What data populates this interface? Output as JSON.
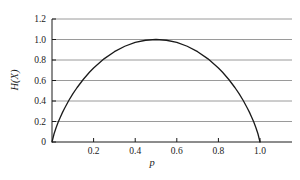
{
  "chart_data": {
    "type": "line",
    "title": "",
    "xlabel": "p",
    "ylabel": "H(X)",
    "xlim": [
      0,
      1.1538
    ],
    "ylim": [
      0,
      1.2
    ],
    "grid": "horizontal",
    "legend": null,
    "x_ticks": [
      0.2,
      0.4,
      0.6,
      0.8,
      1.0
    ],
    "x_tick_labels": [
      "0.2",
      "0.4",
      "0.6",
      "0.8",
      "1.0"
    ],
    "y_ticks": [
      0,
      0.2,
      0.4,
      0.6,
      0.8,
      1.0,
      1.2
    ],
    "y_tick_labels": [
      "0",
      "0.2",
      "0.4",
      "0.6",
      "0.8",
      "1.0",
      "1.2"
    ],
    "series": [
      {
        "name": "H(X)",
        "color": "#1a1a1a",
        "x": [
          0.0,
          0.01,
          0.02,
          0.03,
          0.04,
          0.05,
          0.06,
          0.08,
          0.1,
          0.12,
          0.15,
          0.18,
          0.2,
          0.25,
          0.3,
          0.35,
          0.4,
          0.45,
          0.5,
          0.55,
          0.6,
          0.65,
          0.7,
          0.75,
          0.8,
          0.82,
          0.85,
          0.88,
          0.9,
          0.92,
          0.94,
          0.95,
          0.96,
          0.97,
          0.98,
          0.99,
          1.0
        ],
        "y": [
          0.0,
          0.0808,
          0.1414,
          0.1944,
          0.2423,
          0.2864,
          0.3274,
          0.4022,
          0.469,
          0.5294,
          0.6098,
          0.6801,
          0.7219,
          0.8113,
          0.8813,
          0.9341,
          0.971,
          0.9928,
          1.0,
          0.9928,
          0.971,
          0.9341,
          0.8813,
          0.8113,
          0.7219,
          0.6801,
          0.6098,
          0.5294,
          0.469,
          0.4022,
          0.3274,
          0.2864,
          0.2423,
          0.1944,
          0.1414,
          0.0808,
          0.0
        ]
      }
    ],
    "annotations": []
  },
  "colors": {
    "grid": "#9a9a9a",
    "axis": "#1a1a1a",
    "curve": "#1a1a1a",
    "background": "#ffffff"
  }
}
